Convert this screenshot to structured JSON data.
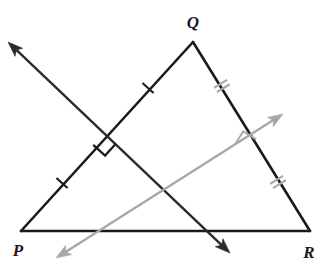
{
  "figure": {
    "width": 322,
    "height": 275,
    "background_color": "#ffffff"
  },
  "colors": {
    "triangle_stroke": "#1a1a1a",
    "dark_ray": "#2b2b2b",
    "gray_ray": "#a8a8a8",
    "tick_dark": "#1a1a1a",
    "tick_gray": "#a8a8a8",
    "right_angle_dark": "#1a1a1a",
    "right_angle_gray": "#a8a8a8",
    "label_color": "#1a1a1a"
  },
  "vertices": {
    "P": {
      "label": "P",
      "x": 21,
      "y": 231,
      "label_x": 18,
      "label_y": 256
    },
    "Q": {
      "label": "Q",
      "x": 193,
      "y": 42,
      "label_x": 193,
      "label_y": 28
    },
    "R": {
      "label": "R",
      "x": 310,
      "y": 231,
      "label_x": 309,
      "label_y": 258
    }
  },
  "sides": [
    {
      "name": "PQ",
      "from": "P",
      "to": "Q",
      "x1": 21,
      "y1": 231,
      "x2": 193,
      "y2": 42,
      "stroke_width": 2.6
    },
    {
      "name": "QR",
      "from": "Q",
      "to": "R",
      "x1": 193,
      "y1": 42,
      "x2": 310,
      "y2": 231,
      "stroke_width": 2.6
    },
    {
      "name": "PR",
      "from": "P",
      "to": "R",
      "x1": 21,
      "y1": 231,
      "x2": 310,
      "y2": 231,
      "stroke_width": 2.6
    }
  ],
  "rays": [
    {
      "name": "perpendicular-bisector-of-pq",
      "color_key": "dark_ray",
      "x1": 8,
      "y1": 42,
      "x2": 230,
      "y2": 253,
      "stroke_width": 2.4,
      "arrow_start": true,
      "arrow_end": true,
      "crosses_side": "PQ",
      "crossing_x": 104,
      "crossing_y": 133
    },
    {
      "name": "perpendicular-bisector-of-qr",
      "color_key": "gray_ray",
      "x1": 283,
      "y1": 114,
      "x2": 56,
      "y2": 258,
      "stroke_width": 2.4,
      "arrow_start": true,
      "arrow_end": true,
      "crosses_side": "QR",
      "crossing_x": 248,
      "crossing_y": 152
    }
  ],
  "tick_marks": [
    {
      "name": "tick-pq-lower",
      "side": "PQ",
      "count": 1,
      "x": 62,
      "y": 183,
      "angle_deg": -47.7,
      "color_key": "tick_dark"
    },
    {
      "name": "tick-pq-upper",
      "side": "PQ",
      "count": 1,
      "x": 148,
      "y": 88,
      "angle_deg": -47.7,
      "color_key": "tick_dark"
    },
    {
      "name": "tick-qr-upper",
      "side": "QR",
      "count": 2,
      "x": 222,
      "y": 86,
      "angle_deg": 58.2,
      "color_key": "tick_gray"
    },
    {
      "name": "tick-qr-lower",
      "side": "QR",
      "count": 2,
      "x": 278,
      "y": 182,
      "angle_deg": 58.2,
      "color_key": "tick_gray"
    }
  ],
  "right_angle_marks": [
    {
      "name": "right-angle-at-pq",
      "x": 104,
      "y": 133,
      "size": 16,
      "angle_deg": 42.3,
      "color_key": "right_angle_dark",
      "stroke_width": 2.2
    },
    {
      "name": "right-angle-at-qr",
      "x": 248,
      "y": 152,
      "size": 15,
      "angle_deg": 212.3,
      "color_key": "right_angle_gray",
      "stroke_width": 2.0
    }
  ],
  "annotations": {
    "congruent_pq_halves": "single tick marks indicate PQ is bisected",
    "congruent_qr_halves": "double tick marks indicate QR is bisected"
  }
}
